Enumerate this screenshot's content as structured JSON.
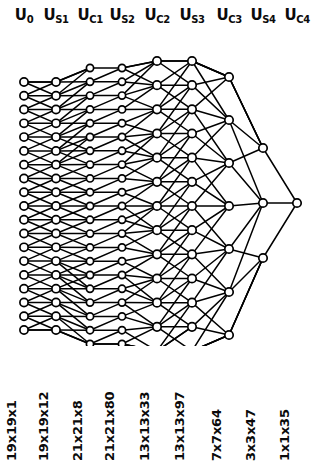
{
  "diagram": {
    "background_color": "#ffffff",
    "ink_color": "#000000",
    "layers": [
      {
        "id": "U0",
        "base": "U",
        "sub": "0",
        "title": "U0",
        "size_label": "19x19x1",
        "node_count": 19,
        "x": 24,
        "top": 46,
        "bottom": 294
      },
      {
        "id": "Us1",
        "base": "U",
        "sub": "S1",
        "title": "Us1",
        "size_label": "19x19x12",
        "node_count": 19,
        "x": 56,
        "top": 46,
        "bottom": 294
      },
      {
        "id": "Uc1",
        "base": "U",
        "sub": "C1",
        "title": "Uc1",
        "size_label": "21x21x8",
        "node_count": 21,
        "x": 90,
        "top": 32,
        "bottom": 308
      },
      {
        "id": "Us2",
        "base": "U",
        "sub": "S2",
        "title": "Us2",
        "size_label": "21x21x80",
        "node_count": 21,
        "x": 122,
        "top": 32,
        "bottom": 308
      },
      {
        "id": "Uc2",
        "base": "U",
        "sub": "C2",
        "title": "Uc2",
        "size_label": "13x13x33",
        "node_count": 13,
        "x": 157,
        "top": 25,
        "bottom": 315
      },
      {
        "id": "Us3",
        "base": "U",
        "sub": "S3",
        "title": "Us3",
        "size_label": "13x13x97",
        "node_count": 13,
        "x": 192,
        "top": 25,
        "bottom": 315
      },
      {
        "id": "Uc3",
        "base": "U",
        "sub": "C3",
        "title": "Uc3",
        "size_label": "7x7x64",
        "node_count": 7,
        "x": 229,
        "top": 41,
        "bottom": 299
      },
      {
        "id": "Us4",
        "base": "U",
        "sub": "S4",
        "title": "Us4",
        "size_label": "3x3x47",
        "node_count": 3,
        "x": 263,
        "top": 112,
        "bottom": 222
      },
      {
        "id": "Uc4",
        "base": "U",
        "sub": "C4",
        "title": "Uc4",
        "size_label": "1x1x35",
        "node_count": 1,
        "x": 297,
        "top": 167,
        "bottom": 167
      }
    ],
    "connection_fanout": [
      3,
      3,
      2,
      4,
      4,
      5,
      5,
      3
    ],
    "node_radius": [
      4.1,
      4.1,
      3.6,
      3.6,
      4.2,
      4.2,
      4.2,
      4.2,
      4.2
    ],
    "edge_width": [
      1.5,
      1.5,
      1.5,
      1.5,
      1.5,
      1.5,
      1.5,
      1.5
    ]
  }
}
